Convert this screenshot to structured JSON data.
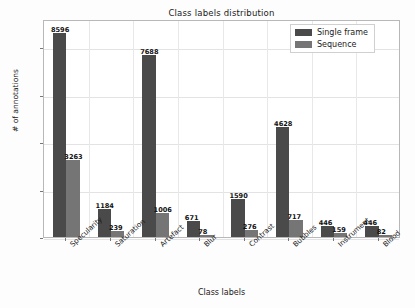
{
  "chart_data": {
    "type": "bar",
    "title": "Class labels distribution",
    "xlabel": "Class labels",
    "ylabel": "# of annotations",
    "categories": [
      "Specularity",
      "Saturation",
      "Artefact",
      "Blur",
      "Contrast",
      "Bubbles",
      "Instrument",
      "Blood"
    ],
    "series": [
      {
        "name": "Single frame",
        "color": "#4a4a4a",
        "values": [
          8596,
          1184,
          7688,
          671,
          1590,
          4628,
          446,
          446
        ]
      },
      {
        "name": "Sequence",
        "color": "#757575",
        "values": [
          3263,
          239,
          1006,
          78,
          276,
          717,
          159,
          82
        ]
      }
    ],
    "ylim": [
      0,
      9200
    ],
    "yticks": [
      0,
      2000,
      4000,
      6000,
      8000
    ],
    "ytick_labels": [
      "0",
      "2000",
      "4000",
      "6000",
      "8000"
    ],
    "grid": true,
    "legend_position": "upper right",
    "background": "#ffffff"
  }
}
